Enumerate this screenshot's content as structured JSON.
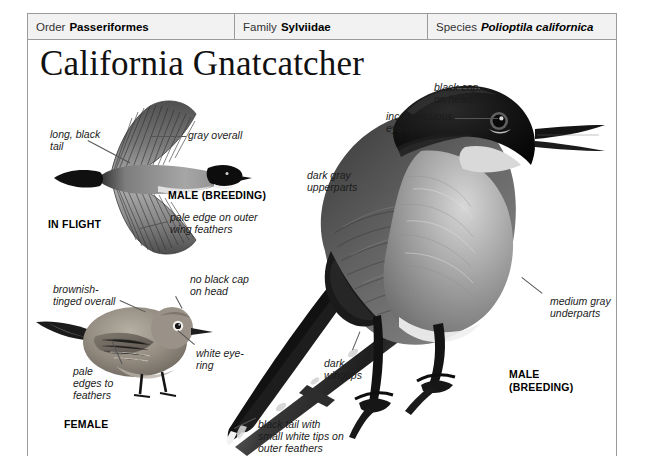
{
  "page": {
    "title": "California Gnatcatcher",
    "taxonomy": [
      {
        "key": "Order",
        "value": "Passeriformes",
        "italic": false
      },
      {
        "key": "Family",
        "value": "Sylviidae",
        "italic": false
      },
      {
        "key": "Species",
        "value": "Polioptila californica",
        "italic": true
      }
    ]
  },
  "inflight": {
    "caption_group": "IN FLIGHT",
    "caption_sex": "MALE (BREEDING)",
    "labels": {
      "tail": "long, black\ntail",
      "overall": "gray overall",
      "wing": "pale edge on outer\nwing feathers"
    }
  },
  "female": {
    "caption_sex": "FEMALE",
    "labels": {
      "overall": "brownish-\ntinged overall",
      "cap": "no black cap\non head",
      "eyering": "white eye-\nring",
      "edges": "pale\nedges to\nfeathers"
    }
  },
  "male": {
    "caption_sex": "MALE\n(BREEDING)",
    "labels": {
      "cap": "black cap\non head",
      "eyering": "inconspicuous\neye-ring",
      "upperparts": "dark gray\nupperparts",
      "underparts": "medium gray\nunderparts",
      "wingtips": "dark\nwingtips",
      "tail": "black tail with\nsmall white tips on\nouter feathers"
    }
  },
  "colors": {
    "frame": "#9a9a9a",
    "header_bg": "#f2f2f2",
    "text": "#1a1a1a",
    "leader": "#555555",
    "bird_black": "#121212",
    "bird_dark_gray": "#4a4a4a",
    "bird_mid_gray": "#8d8d8d",
    "bird_light_gray": "#c9c9c9",
    "bird_brown_gray": "#8a8176"
  }
}
